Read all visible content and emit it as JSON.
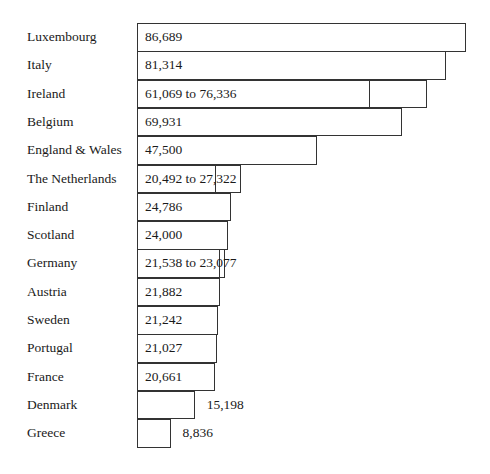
{
  "chart_data": {
    "type": "bar",
    "orientation": "horizontal",
    "title": "",
    "xlabel": "",
    "ylabel": "",
    "grid": false,
    "categories": [
      "Luxembourg",
      "Italy",
      "Ireland",
      "Belgium",
      "England & Wales",
      "The Netherlands",
      "Finland",
      "Scotland",
      "Germany",
      "Austria",
      "Sweden",
      "Portugal",
      "France",
      "Denmark",
      "Greece"
    ],
    "values": [
      86689,
      81314,
      76336,
      69931,
      47500,
      27322,
      24786,
      24000,
      23077,
      21882,
      21242,
      21027,
      20661,
      15198,
      8836
    ],
    "range_low": [
      null,
      null,
      61069,
      null,
      null,
      20492,
      null,
      null,
      21538,
      null,
      null,
      null,
      null,
      null,
      null
    ],
    "labels": [
      "86,689",
      "81,314",
      "61,069 to 76,336",
      "69,931",
      "47,500",
      "20,492 to 27,322",
      "24,786",
      "24,000",
      "21,538 to 23,077",
      "21,882",
      "21,242",
      "21,027",
      "20,661",
      "15,198",
      "8,836"
    ]
  }
}
